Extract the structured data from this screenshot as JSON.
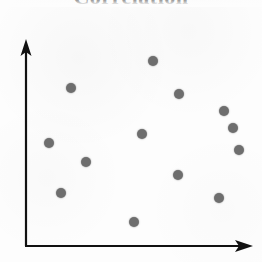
{
  "figure": {
    "width": 262,
    "height": 262,
    "background_color": "#fdfdfd"
  },
  "title": {
    "text": "Correlation",
    "note": "bold serif heading, cropped by top edge of image",
    "color": "#1a1a1a"
  },
  "axes": {
    "color": "#111111",
    "line_width": 2,
    "y_axis": {
      "x": 26,
      "y_top": 40,
      "y_bottom": 246,
      "arrow": "up"
    },
    "x_axis": {
      "y": 246,
      "x_left": 26,
      "x_right": 252,
      "arrow": "right"
    }
  },
  "marker": {
    "color": "#6e6e6e",
    "diameter": 10,
    "shape": "circle"
  },
  "chart_data": {
    "type": "scatter",
    "title": "Correlation",
    "xlabel": "",
    "ylabel": "",
    "grid": false,
    "legend": "none",
    "axis_style": "arrow axes, no tick marks, no tick labels",
    "xlim": [
      0,
      100
    ],
    "ylim": [
      0,
      100
    ],
    "n_points": 13,
    "relationship": "no correlation (random cloud)",
    "series": [
      {
        "name": "points",
        "color": "#6e6e6e",
        "x": [
          56,
          20,
          68,
          88,
          51,
          10,
          94,
          27,
          67,
          16,
          85,
          48,
          96
        ],
        "y": [
          90,
          77,
          74,
          66,
          54,
          50,
          47,
          41,
          35,
          26,
          23,
          12,
          58
        ],
        "pixels": [
          {
            "cx": 153,
            "cy": 61
          },
          {
            "cx": 71,
            "cy": 88
          },
          {
            "cx": 179,
            "cy": 94
          },
          {
            "cx": 224,
            "cy": 111
          },
          {
            "cx": 142,
            "cy": 134
          },
          {
            "cx": 49,
            "cy": 143
          },
          {
            "cx": 239,
            "cy": 150
          },
          {
            "cx": 86,
            "cy": 162
          },
          {
            "cx": 178,
            "cy": 175
          },
          {
            "cx": 61,
            "cy": 193
          },
          {
            "cx": 219,
            "cy": 198
          },
          {
            "cx": 134,
            "cy": 222
          },
          {
            "cx": 233,
            "cy": 128
          }
        ]
      }
    ]
  }
}
